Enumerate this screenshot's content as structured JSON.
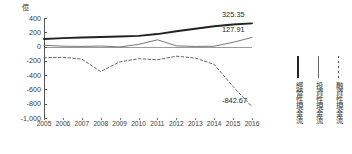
{
  "chart_data": {
    "type": "line",
    "title": "",
    "xlabel": "",
    "ylabel": "億",
    "unit_label": "億",
    "x": [
      "2005",
      "2006",
      "2007",
      "2008",
      "2009",
      "2010",
      "2011",
      "2012",
      "2013",
      "2014",
      "2015",
      "2016"
    ],
    "categories": [
      "2005",
      "2006",
      "2007",
      "2008",
      "2009",
      "2010",
      "2011",
      "2012",
      "2013",
      "2014",
      "2015",
      "2016"
    ],
    "ylim": [
      -1000,
      400
    ],
    "yticks": [
      "400",
      "200",
      "0",
      "-200",
      "-400",
      "-600",
      "-800",
      "-1,000"
    ],
    "ytick_values": [
      400,
      200,
      0,
      -200,
      -400,
      -600,
      -800,
      -1000
    ],
    "grid": false,
    "legend_position": "right",
    "series": [
      {
        "name": "經營性現金流",
        "style": "solid-thick",
        "color": "#222222",
        "values": [
          105,
          118,
          128,
          135,
          140,
          150,
          175,
          215,
          250,
          285,
          310,
          325.35
        ],
        "end_label": "325.35"
      },
      {
        "name": "投資性現金流",
        "style": "solid-thin",
        "color": "#666666",
        "values": [
          18,
          5,
          2,
          8,
          -5,
          30,
          95,
          10,
          2,
          5,
          60,
          127.91
        ],
        "end_label": "127.91"
      },
      {
        "name": "融資性現金流",
        "style": "dashed",
        "color": "#555555",
        "values": [
          -155,
          -150,
          -175,
          -350,
          -215,
          -170,
          -185,
          -135,
          -160,
          -250,
          -560,
          -842.67
        ],
        "end_label": "-842.67"
      }
    ],
    "annotations": [
      {
        "text": "325.35",
        "series": "經營性現金流",
        "x": "2016"
      },
      {
        "text": "127.91",
        "series": "投資性現金流",
        "x": "2016"
      },
      {
        "text": "-842.67",
        "series": "融資性現金流",
        "x": "2016"
      }
    ]
  },
  "legend": {
    "items": [
      {
        "label": "經營性現金流",
        "style": "solid-thick"
      },
      {
        "label": "投資性現金流",
        "style": "solid-thin"
      },
      {
        "label": "融資性現金流",
        "style": "dashed"
      }
    ]
  }
}
